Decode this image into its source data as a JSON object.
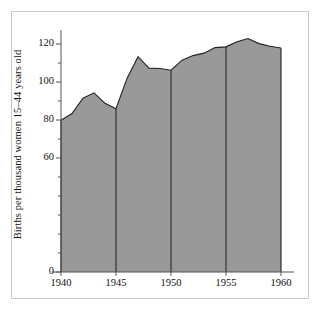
{
  "chart_data": {
    "type": "area",
    "title": "",
    "subtitle": "",
    "xlabel": "",
    "ylabel": "Births per thousand women 15–44 years old",
    "xlim": [
      1940,
      1960
    ],
    "ylim": [
      0,
      130
    ],
    "grid": false,
    "legend": null,
    "fill_color": "#999999",
    "line_color": "#222222",
    "axis_color": "#555555",
    "frame_color": "#c9c9c9",
    "background_color": "#ffffff",
    "x": [
      1940,
      1941,
      1942,
      1943,
      1944,
      1945,
      1946,
      1947,
      1948,
      1949,
      1950,
      1951,
      1952,
      1953,
      1954,
      1955,
      1956,
      1957,
      1958,
      1959,
      1960
    ],
    "values": [
      79.9,
      83.4,
      91.5,
      94.3,
      88.8,
      85.9,
      101.9,
      113.3,
      107.3,
      107.1,
      106.2,
      111.5,
      113.9,
      115.2,
      118.1,
      118.5,
      121.2,
      122.9,
      120.2,
      118.8,
      117.9
    ],
    "xticks": [
      1940,
      1945,
      1950,
      1955,
      1960
    ],
    "xtick_labels": [
      "1940",
      "1945",
      "1950",
      "1955",
      "1960"
    ],
    "yticks": [
      0,
      60,
      80,
      100,
      120
    ],
    "ytick_labels": [
      "0",
      "60",
      "80",
      "100",
      "120"
    ],
    "yminor_ticks": [
      10,
      20,
      30,
      40,
      50,
      70,
      90,
      110
    ],
    "vertical_rules": [
      1945,
      1950,
      1955
    ],
    "annotations": []
  },
  "axis": {
    "y_label_text": "Births per thousand women 15–44 years old"
  }
}
